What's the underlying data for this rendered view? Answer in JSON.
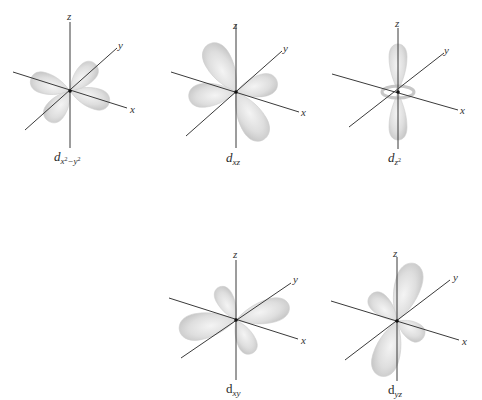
{
  "figure": {
    "lobe_color": "#d9d9d9",
    "axis_color": "#3a3a3a",
    "axis_labels": {
      "x": "x",
      "y": "y",
      "z": "z"
    },
    "orbitals": [
      {
        "id": "dx2-y2",
        "label_main": "d",
        "label_sub": "x",
        "label_sup1": "2",
        "label_mid": "−y",
        "label_sup2": "2",
        "center": [
          70,
          91
        ]
      },
      {
        "id": "dxz",
        "label_main": "d",
        "label_sub": "xz",
        "center": [
          236,
          92
        ]
      },
      {
        "id": "dz2",
        "label_main": "d",
        "label_sub": "z",
        "label_sup1": "2",
        "center": [
          398,
          92
        ]
      },
      {
        "id": "dxy",
        "label_main": "d",
        "label_sub": "xy",
        "center": [
          236,
          320
        ]
      },
      {
        "id": "dyz",
        "label_main": "d",
        "label_sub": "yz",
        "center": [
          397,
          321
        ]
      }
    ]
  }
}
